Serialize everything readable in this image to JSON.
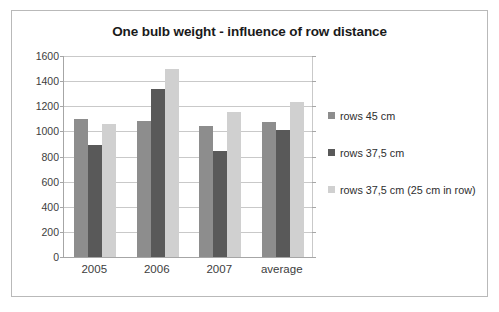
{
  "chart_data": {
    "type": "bar",
    "title": "One bulb weight - influence of row distance",
    "xlabel": "",
    "ylabel": "",
    "categories": [
      "2005",
      "2006",
      "2007",
      "average"
    ],
    "series": [
      {
        "name": "rows 45 cm",
        "color": "#8d8d8d",
        "values": [
          1100,
          1080,
          1045,
          1075
        ]
      },
      {
        "name": "rows 37,5 cm",
        "color": "#595959",
        "values": [
          890,
          1335,
          845,
          1015
        ]
      },
      {
        "name": "rows 37,5 cm (25 cm in row)",
        "color": "#d0d0d0",
        "values": [
          1055,
          1495,
          1155,
          1230
        ]
      }
    ],
    "ylim": [
      0,
      1600
    ],
    "ytick_labels": [
      "1600",
      "1400",
      "1200",
      "1000",
      "800",
      "600",
      "400",
      "200",
      "0"
    ],
    "ytick_values": [
      1600,
      1400,
      1200,
      1000,
      800,
      600,
      400,
      200,
      0
    ],
    "grid": true,
    "legend_position": "right"
  },
  "legend": {
    "items": [
      {
        "label": "rows 45 cm",
        "swatch": "legend-swatch-series-1"
      },
      {
        "label": "rows 37,5 cm",
        "swatch": "legend-swatch-series-2"
      },
      {
        "label": "rows 37,5 cm (25 cm in row)",
        "swatch": "legend-swatch-series-3"
      }
    ]
  }
}
